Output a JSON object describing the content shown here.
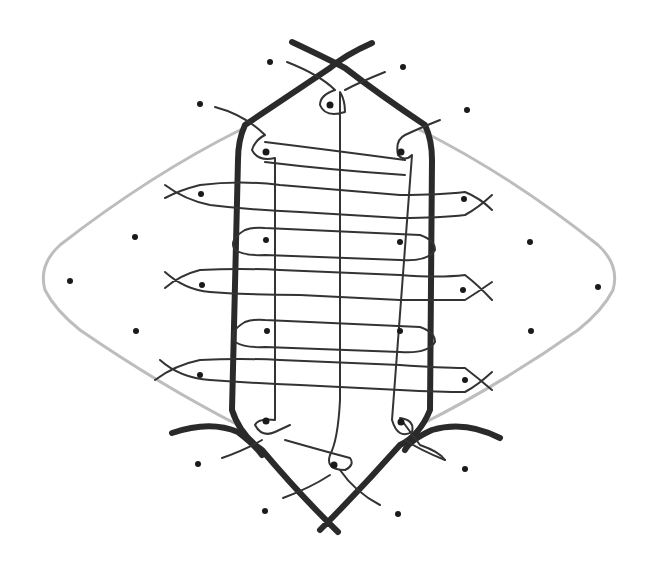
{
  "diagram": {
    "type": "hand-drawn kolam-style line drawing",
    "colors": {
      "background": "#ffffff",
      "thick_stroke": "#2a2a2a",
      "thin_stroke": "#333333",
      "outer_outline": "#bdbdbd",
      "dots": "#1a1a1a"
    },
    "elements": {
      "outer_outline": "grey rounded diamond",
      "inner_frame": "thick elongated hexagon with crossed ends",
      "weave": "thin interlaced loops around dots",
      "dot_count": 31
    }
  }
}
